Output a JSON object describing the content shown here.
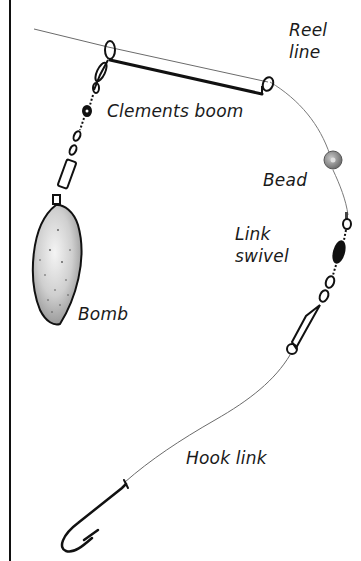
{
  "diagram": {
    "labels": {
      "reel_line": "Reel\nline",
      "clements_boom": "Clements boom",
      "bead": "Bead",
      "link_swivel": "Link\nswivel",
      "bomb": "Bomb",
      "hook_link": "Hook link"
    },
    "colors": {
      "line": "#111111",
      "thin_line": "#6b6b6b",
      "bead": "#8a8a8a",
      "bomb_fill": "#d9d9d9",
      "background": "#ffffff"
    },
    "components": [
      "reel-line",
      "clements-boom",
      "swivel-chain",
      "bomb",
      "bead",
      "link-swivel",
      "hook-link",
      "hook"
    ]
  }
}
